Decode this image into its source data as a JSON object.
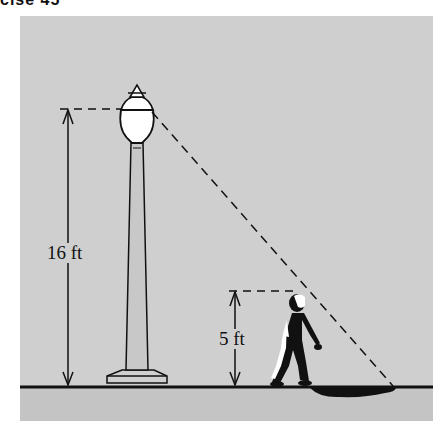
{
  "header": {
    "fragment": "cise 45"
  },
  "figure": {
    "background_color": "#cfcfcf",
    "ground_below_color": "#c4c4c4",
    "lamp_height_label": "16 ft",
    "person_height_label": "5 ft",
    "objects": [
      "street lamp",
      "walking person",
      "shadow",
      "ground line",
      "light ray (dashed)"
    ]
  }
}
